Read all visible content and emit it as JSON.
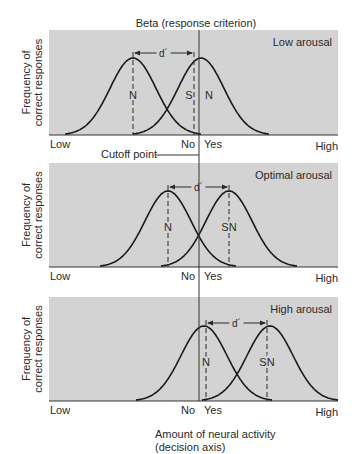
{
  "diagram": {
    "title": "Beta (response criterion)",
    "cutoff_label": "Cutoff point",
    "y_axis_label_line1": "Frequency of",
    "y_axis_label_line2": "correct responses",
    "x_axis_title_line1": "Amount of neural activity",
    "x_axis_title_line2": "(decision axis)",
    "d_prime_label": "d´",
    "cutoff_x": 199,
    "colors": {
      "panel_fill": "#d3d3d3",
      "curve": "#1a1a1a",
      "text": "#2a2a2a"
    },
    "panels": [
      {
        "id": "low-arousal",
        "label": "Low arousal",
        "x_low_label": "Low",
        "x_no_label": "No",
        "x_yes_label": "Yes",
        "x_high_label": "High",
        "top": 30,
        "baseline": 135,
        "noise_peak_x": 133,
        "signal_peak_x": 201,
        "peak_y": 58,
        "noise_dash_x": 133,
        "signal_dash_x": 194,
        "dprime_y": 53,
        "noise_label": "N",
        "signal_label_left": "S",
        "signal_label_right": "N",
        "split_signal_label": true,
        "label_y": 99
      },
      {
        "id": "optimal-arousal",
        "label": "Optimal arousal",
        "x_low_label": "Low",
        "x_no_label": "No",
        "x_yes_label": "Yes",
        "x_high_label": "High",
        "top": 163,
        "baseline": 267,
        "noise_peak_x": 168,
        "signal_peak_x": 229,
        "peak_y": 191,
        "noise_dash_x": 168,
        "signal_dash_x": 229,
        "dprime_y": 187,
        "noise_label": "N",
        "signal_label": "SN",
        "split_signal_label": false,
        "label_y": 231
      },
      {
        "id": "high-arousal",
        "label": "High arousal",
        "x_low_label": "Low",
        "x_no_label": "No",
        "x_yes_label": "Yes",
        "x_high_label": "High",
        "top": 297,
        "baseline": 401,
        "noise_peak_x": 204,
        "signal_peak_x": 270,
        "peak_y": 326,
        "noise_dash_x": 206,
        "signal_dash_x": 267,
        "dprime_y": 323,
        "noise_label": "N",
        "signal_label": "SN",
        "split_signal_label": false,
        "label_y": 366
      }
    ]
  }
}
